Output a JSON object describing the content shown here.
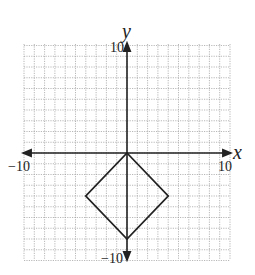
{
  "diagram": {
    "type": "coordinate-plane",
    "x_axis": {
      "label": "x",
      "min": -10,
      "max": 10,
      "min_label": "−10",
      "max_label": "10"
    },
    "y_axis": {
      "label": "y",
      "min": -10,
      "max": 10,
      "min_label": "−10",
      "max_label": "10"
    },
    "grid": {
      "step": 1,
      "style": "dotted"
    },
    "shape": {
      "name": "square",
      "vertices": [
        [
          0,
          0
        ],
        [
          4,
          -4
        ],
        [
          0,
          -8
        ],
        [
          -4,
          -4
        ]
      ]
    },
    "colors": {
      "grid": "#9a9a9a",
      "axis": "#222222",
      "shape": "#222222"
    }
  }
}
